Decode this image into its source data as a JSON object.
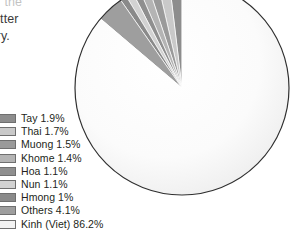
{
  "body_text": {
    "lines": [
      "for the",
      "better",
      "tory."
    ]
  },
  "chart_data": {
    "type": "pie",
    "title": "",
    "subtitle": "",
    "xlabel": "",
    "ylabel": "",
    "legend_position": "bottom-left",
    "grid": false,
    "units": "percent",
    "start_angle_deg": -90,
    "direction": "counterclockwise",
    "categories": [
      "Tay",
      "Thai",
      "Muong",
      "Khome",
      "Hoa",
      "Nun",
      "Hmong",
      "Others",
      "Kinh (Viet)"
    ],
    "values": [
      1.9,
      1.7,
      1.5,
      1.4,
      1.1,
      1.1,
      1.0,
      4.1,
      86.2
    ],
    "labels": [
      "Tay 1.9%",
      "Thai 1.7%",
      "Muong 1.5%",
      "Khome 1.4%",
      "Hoa 1.1%",
      "Nun 1.1%",
      "Hmong 1%",
      "Others 4.1%",
      "Kinh (Viet) 86.2%"
    ],
    "colors": [
      "#8d8d8d",
      "#c9c9c9",
      "#9a9a9a",
      "#b4b4b4",
      "#8f8f8f",
      "#d2d2d2",
      "#8a8a8a",
      "#9e9e9e",
      "#f2f2f2"
    ],
    "outline_color": "#2f2f2f"
  }
}
